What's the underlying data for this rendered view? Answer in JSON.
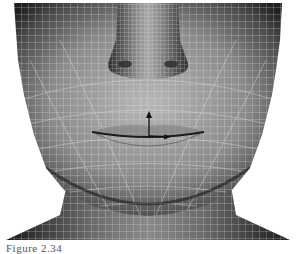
{
  "figure": {
    "manipulator": {
      "type": "move-gizmo",
      "axes": [
        "y-up",
        "x-right"
      ]
    },
    "colors": {
      "mesh_dark": "#2a2a2a",
      "mesh_mid": "#8a8a8a",
      "mesh_light": "#c8c8c8",
      "grid_lines": "#e6e6e6",
      "background": "#ffffff"
    }
  },
  "caption": {
    "label": "Figure 2.34"
  }
}
